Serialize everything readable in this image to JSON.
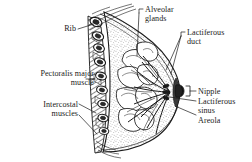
{
  "figure": {
    "type": "anatomical-illustration",
    "background_color": "#ffffff",
    "ink_color": "#1a1a1a",
    "width": 252,
    "height": 162
  },
  "labels": {
    "rib": "Rib",
    "pectoralis_major_line1": "Pectoralis major",
    "pectoralis_major_line2": "muscle",
    "intercostal_line1": "Intercostal",
    "intercostal_line2": "muscles",
    "alveolar_line1": "Alveolar",
    "alveolar_line2": "glands",
    "lactiferous_duct_line1": "Lactiferous",
    "lactiferous_duct_line2": "duct",
    "nipple": "Nipple",
    "lactiferous_sinus_line1": "Lactiferous",
    "lactiferous_sinus_line2": "sinus",
    "areola": "Areola"
  },
  "structures": [
    {
      "name": "rib",
      "label": "Rib",
      "side": "left"
    },
    {
      "name": "pectoralis-major-muscle",
      "label": "Pectoralis major muscle",
      "side": "left"
    },
    {
      "name": "intercostal-muscles",
      "label": "Intercostal muscles",
      "side": "left"
    },
    {
      "name": "alveolar-glands",
      "label": "Alveolar glands",
      "side": "top"
    },
    {
      "name": "lactiferous-duct",
      "label": "Lactiferous duct",
      "side": "right"
    },
    {
      "name": "nipple",
      "label": "Nipple",
      "side": "right"
    },
    {
      "name": "lactiferous-sinus",
      "label": "Lactiferous sinus",
      "side": "right"
    },
    {
      "name": "areola",
      "label": "Areola",
      "side": "right"
    }
  ]
}
